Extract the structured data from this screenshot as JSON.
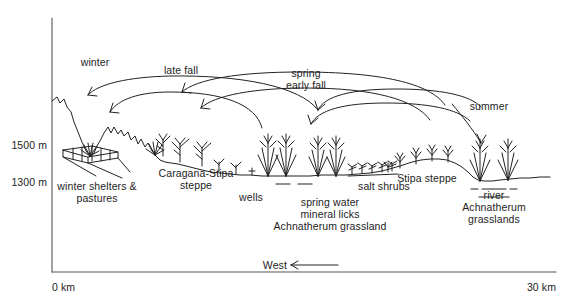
{
  "figure": {
    "type": "landscape-transect-diagram",
    "title_visible": false,
    "background_color": "#ffffff",
    "line_color": "#222222"
  },
  "axes": {
    "y_axis": {
      "name": "elevation",
      "ticks": [
        {
          "label": "1500 m",
          "value": 1500
        },
        {
          "label": "1300 m",
          "value": 1300
        }
      ]
    },
    "x_axis": {
      "name": "distance",
      "ticks": [
        {
          "label": "0 km",
          "value": 0
        },
        {
          "label": "30 km",
          "value": 30
        }
      ],
      "direction_label": "West"
    }
  },
  "season_arrows": [
    {
      "id": "winter",
      "label": "winter"
    },
    {
      "id": "late-fall",
      "label": "late fall"
    },
    {
      "id": "spring-early-fall",
      "label": "spring\nearly fall",
      "line1": "spring",
      "line2": "early fall"
    },
    {
      "id": "summer",
      "label": "summer"
    }
  ],
  "zones": [
    {
      "id": "winter-shelters",
      "line1": "winter shelters &",
      "line2": "pastures"
    },
    {
      "id": "caragana-stipa-steppe",
      "line1": "Caragana-Stipa",
      "line2": "steppe"
    },
    {
      "id": "wells",
      "line1": "wells"
    },
    {
      "id": "spring-water",
      "line1": "spring water",
      "line2": "mineral licks",
      "line3": "Achnatherum grassland"
    },
    {
      "id": "salt-shrubs",
      "line1": "salt shrubs"
    },
    {
      "id": "stipa-steppe",
      "line1": "Stipa steppe"
    },
    {
      "id": "river-achnatherum",
      "line1": "river",
      "line2": "Achnatherum",
      "line3": "grasslands"
    }
  ]
}
